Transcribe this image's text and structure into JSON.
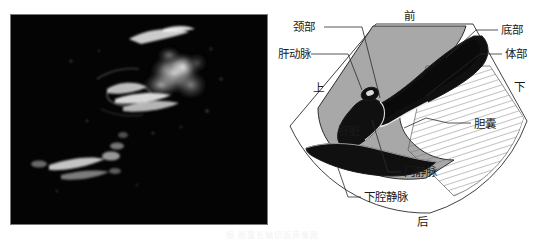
{
  "figure": {
    "width": 545,
    "height": 240,
    "caption": "图 胆囊长轴切面声像图"
  },
  "ultrasound": {
    "alt_name": "胆囊长轴切面超声声像图",
    "background_color": "#050505",
    "border_color": "#7a7a7a",
    "echo_color": "#ffffff"
  },
  "diagram": {
    "colors": {
      "liver_fill": "#a8a8a8",
      "vessel_fill": "#101010",
      "gallbladder_fill": "#ffffff",
      "outline": "#2b2b2b",
      "hatch": "#6f6f6f",
      "label_text": "#1a1a1a"
    },
    "orientation": {
      "anterior": "前",
      "posterior": "后",
      "superior": "上",
      "inferior": "下"
    },
    "labels": [
      {
        "id": "neck",
        "text": "颈部",
        "x": 17,
        "y": 27
      },
      {
        "id": "hepatic-artery",
        "text": "肝动脉",
        "x": 2,
        "y": 54
      },
      {
        "id": "superior",
        "text": "上",
        "x": 37,
        "y": 88
      },
      {
        "id": "anterior",
        "text": "前",
        "x": 128,
        "y": 20
      },
      {
        "id": "fundus",
        "text": "底部",
        "x": 225,
        "y": 30
      },
      {
        "id": "body",
        "text": "体部",
        "x": 229,
        "y": 54
      },
      {
        "id": "inferior",
        "text": "下",
        "x": 238,
        "y": 87
      },
      {
        "id": "gallbladder",
        "text": "胆囊",
        "x": 198,
        "y": 125
      },
      {
        "id": "liver",
        "text": "肝脏",
        "x": 62,
        "y": 131
      },
      {
        "id": "portal-vein",
        "text": "门静脉",
        "x": 128,
        "y": 172
      },
      {
        "id": "ivc",
        "text": "下腔静脉",
        "x": 88,
        "y": 197
      },
      {
        "id": "posterior",
        "text": "后",
        "x": 141,
        "y": 222
      }
    ]
  }
}
